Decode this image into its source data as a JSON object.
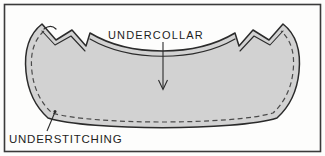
{
  "figure": {
    "caption_labels": {
      "undercollar": "UNDERCOLLAR",
      "understitching": "UNDERSTITCHING"
    },
    "colors": {
      "frame_stroke": "#3a3a3a",
      "background": "#fdfdfc",
      "collar_fill": "#d2d2d2",
      "collar_outline": "#2b2b2b",
      "stitch_dash": "#4a4a4a",
      "leader_line": "#2b2b2b",
      "text": "#1d1d1d"
    },
    "elements": {
      "frame_label": "illustration-border",
      "shape_label": "undercollar-piece",
      "dashed_label": "understitching-dashed-line",
      "arrow_label": "undercollar-arrow",
      "leader_label": "understitching-leader-line",
      "notch_left_label": "left-lapel-notch",
      "notch_right_label": "right-lapel-notch"
    }
  }
}
